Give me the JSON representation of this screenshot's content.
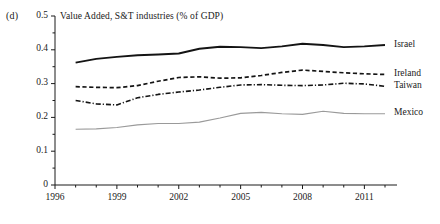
{
  "panel": {
    "label": "(d)"
  },
  "chart_data": {
    "type": "line",
    "title": "Value Added, S&T industries (% of GDP)",
    "xlabel": "",
    "ylabel": "",
    "xlim": [
      1996,
      2012
    ],
    "ylim": [
      0,
      0.5
    ],
    "grid": false,
    "legend_position": "right-of-lines",
    "x": [
      1997,
      1998,
      1999,
      2000,
      2001,
      2002,
      2003,
      2004,
      2005,
      2006,
      2007,
      2008,
      2009,
      2010,
      2011,
      2012
    ],
    "xticks": [
      1996,
      1997,
      1998,
      1999,
      2000,
      2001,
      2002,
      2003,
      2004,
      2005,
      2006,
      2007,
      2008,
      2009,
      2010,
      2011,
      2012
    ],
    "xtick_labels": [
      "1996",
      "1999",
      "2002",
      "2005",
      "2008",
      "2011"
    ],
    "xtick_label_values": [
      1996,
      1999,
      2002,
      2005,
      2008,
      2011
    ],
    "yticks": [
      0,
      0.1,
      0.2,
      0.3,
      0.4,
      0.5
    ],
    "ytick_labels": [
      "0",
      "0.1",
      "0.2",
      "0.3",
      "0.4",
      "0.5"
    ],
    "yminor_step": 0.05,
    "series": [
      {
        "name": "Israel",
        "style": "solid",
        "color": "#141414",
        "width": 1.9,
        "values": [
          0.362,
          0.373,
          0.379,
          0.384,
          0.386,
          0.389,
          0.403,
          0.409,
          0.408,
          0.405,
          0.41,
          0.418,
          0.414,
          0.408,
          0.41,
          0.414
        ]
      },
      {
        "name": "Ireland",
        "style": "dashed",
        "color": "#141414",
        "width": 1.7,
        "values": [
          0.291,
          0.289,
          0.288,
          0.294,
          0.307,
          0.318,
          0.32,
          0.316,
          0.317,
          0.324,
          0.333,
          0.34,
          0.336,
          0.332,
          0.329,
          0.327
        ]
      },
      {
        "name": "Taiwan",
        "style": "dashdot",
        "color": "#141414",
        "width": 1.6,
        "values": [
          0.25,
          0.24,
          0.237,
          0.258,
          0.268,
          0.275,
          0.281,
          0.289,
          0.296,
          0.297,
          0.295,
          0.294,
          0.296,
          0.301,
          0.299,
          0.292
        ]
      },
      {
        "name": "Mexico",
        "style": "solid",
        "color": "#9a9a9a",
        "width": 1.1,
        "values": [
          0.165,
          0.166,
          0.17,
          0.178,
          0.182,
          0.182,
          0.186,
          0.198,
          0.212,
          0.215,
          0.211,
          0.209,
          0.218,
          0.212,
          0.211,
          0.211
        ]
      }
    ]
  }
}
